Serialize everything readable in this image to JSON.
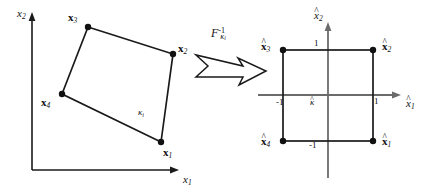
{
  "figure": {
    "stroke_color": "#1a1a1a",
    "text_color": "#111111",
    "background": "#ffffff"
  },
  "left_panel": {
    "name": "physical-element",
    "axes": {
      "x_label": "x",
      "x_label_sub": "1",
      "y_label": "x",
      "y_label_sub": "2"
    },
    "region_label": {
      "symbol": "κ",
      "sub": "i"
    },
    "vertices": [
      {
        "label": "x",
        "sub": "1",
        "x": 161,
        "y": 142,
        "label_x": 163,
        "label_y": 152
      },
      {
        "label": "x",
        "sub": "2",
        "x": 173,
        "y": 54,
        "label_x": 178,
        "label_y": 48
      },
      {
        "label": "x",
        "sub": "3",
        "x": 88,
        "y": 27,
        "label_x": 70,
        "label_y": 18
      },
      {
        "label": "x",
        "sub": "4",
        "x": 62,
        "y": 94,
        "label_x": 42,
        "label_y": 104
      }
    ]
  },
  "map_arrow": {
    "name": "inverse-map-arrow",
    "label_main": "F",
    "label_sup": "-1",
    "label_sub": "κ",
    "label_sub_sub": "i"
  },
  "right_panel": {
    "name": "reference-element",
    "axes": {
      "x_label": "x",
      "x_label_sub": "1",
      "y_label": "x",
      "y_label_sub": "2"
    },
    "region_label": {
      "symbol": "κ"
    },
    "ticks": [
      {
        "name": "tick-y-plus-one",
        "text": "1",
        "x": 314,
        "y": 45
      },
      {
        "name": "tick-y-minus-one",
        "text": "-1",
        "x": 312,
        "y": 143
      },
      {
        "name": "tick-x-minus-one",
        "text": "-1",
        "x": 279,
        "y": 100
      },
      {
        "name": "tick-x-plus-one",
        "text": "1",
        "x": 374,
        "y": 100
      }
    ],
    "vertices": [
      {
        "label": "x",
        "sub": "1",
        "x": 373,
        "y": 141,
        "label_x": 383,
        "label_y": 141
      },
      {
        "label": "x",
        "sub": "2",
        "x": 373,
        "y": 50,
        "label_x": 383,
        "label_y": 44
      },
      {
        "label": "x",
        "sub": "3",
        "x": 283,
        "y": 50,
        "label_x": 262,
        "label_y": 44
      },
      {
        "label": "x",
        "sub": "4",
        "x": 283,
        "y": 141,
        "label_x": 262,
        "label_y": 141
      }
    ]
  }
}
